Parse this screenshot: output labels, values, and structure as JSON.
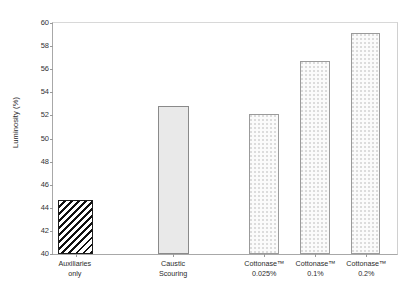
{
  "chart_data": {
    "type": "bar",
    "title": "",
    "xlabel": "",
    "ylabel": "Luminosity (%)",
    "ylim": [
      40,
      60
    ],
    "yticks": [
      40,
      42,
      44,
      46,
      48,
      50,
      52,
      54,
      56,
      58,
      60
    ],
    "grid": false,
    "legend": null,
    "categories": [
      "Auxiliaries only",
      "Caustic Scouring",
      "Cottonase™ 0.025%",
      "Cottonase™ 0.1%",
      "Cottonase™ 0.2%"
    ],
    "values": [
      44.7,
      52.8,
      52.1,
      56.7,
      59.1
    ],
    "bars": [
      {
        "label_line1": "Auxiliaries",
        "label_line2": "only",
        "value": 44.7,
        "fill": "hatch",
        "left_pct": 1.5,
        "width_pct": 10.2
      },
      {
        "label_line1": "Caustic",
        "label_line2": "Scouring",
        "value": 52.8,
        "fill": "solid",
        "left_pct": 30.5,
        "width_pct": 9.0
      },
      {
        "label_line1": "Cottonase™",
        "label_line2": "0.025%",
        "value": 52.1,
        "fill": "dots",
        "left_pct": 57.0,
        "width_pct": 8.7
      },
      {
        "label_line1": "Cottonase™",
        "label_line2": "0.1%",
        "value": 56.7,
        "fill": "dots",
        "left_pct": 71.8,
        "width_pct": 8.7
      },
      {
        "label_line1": "Cottonase™",
        "label_line2": "0.2%",
        "value": 59.1,
        "fill": "dots",
        "left_pct": 86.5,
        "width_pct": 8.7
      }
    ],
    "colors": {
      "background": "#ffffff",
      "axis": "#a8a8a8",
      "text": "#2b2b2b",
      "bar_solid": "#e9e9e9",
      "bar_dots": "#fbfbfb",
      "bar_hatch_line": "#111111"
    }
  }
}
